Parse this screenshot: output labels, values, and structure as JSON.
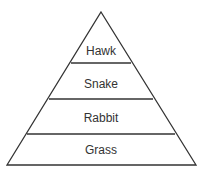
{
  "diagram": {
    "type": "food-pyramid",
    "levels": [
      {
        "label": "Hawk"
      },
      {
        "label": "Snake"
      },
      {
        "label": "Rabbit"
      },
      {
        "label": "Grass"
      }
    ],
    "line_color": "#333333",
    "background": "#ffffff"
  }
}
